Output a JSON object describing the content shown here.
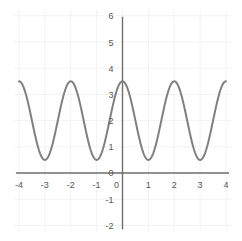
{
  "chart_data": {
    "type": "line",
    "title": "",
    "subtitle": "",
    "xlabel": "",
    "ylabel": "",
    "xlim": [
      -4,
      4
    ],
    "ylim": [
      -2,
      6
    ],
    "grid": true,
    "legend": "none",
    "xticks": [
      "-4",
      "-3",
      "-2",
      "-1",
      "0",
      "1",
      "2",
      "3",
      "4"
    ],
    "xtick_values": [
      -4,
      -3,
      -2,
      -1,
      0,
      1,
      2,
      3,
      4
    ],
    "yticks": [
      "6",
      "5",
      "4",
      "3",
      "2",
      "1",
      "0",
      "-1",
      "-2"
    ],
    "ytick_values": [
      6,
      5,
      4,
      3,
      2,
      1,
      0,
      -1,
      -2
    ],
    "series": [
      {
        "name": "cosine-curve",
        "expression": "y = 2 + 1.5*cos(pi*x)",
        "amplitude": 1.5,
        "midline": 2,
        "period": 2,
        "maximum": 3.5,
        "minimum": 0.5,
        "color": "#808080",
        "line_width": 2,
        "x": [
          -4,
          -3.75,
          -3.5,
          -3.25,
          -3,
          -2.75,
          -2.5,
          -2.25,
          -2,
          -1.75,
          -1.5,
          -1.25,
          -1,
          -0.75,
          -0.5,
          -0.25,
          0,
          0.25,
          0.5,
          0.75,
          1,
          1.25,
          1.5,
          1.75,
          2,
          2.25,
          2.5,
          2.75,
          3,
          3.25,
          3.5,
          3.75,
          4
        ],
        "y": [
          3.5,
          3.06,
          2.0,
          0.94,
          0.5,
          0.94,
          2.0,
          3.06,
          3.5,
          3.06,
          2.0,
          0.94,
          0.5,
          0.94,
          2.0,
          3.06,
          3.5,
          3.06,
          2.0,
          0.94,
          0.5,
          0.94,
          2.0,
          3.06,
          3.5,
          3.06,
          2.0,
          0.94,
          0.5,
          0.94,
          2.0,
          3.06,
          3.5
        ],
        "maxima_at": [
          -4,
          -2,
          0,
          2,
          4
        ],
        "minima_at": [
          -3,
          -1,
          1,
          3
        ]
      }
    ],
    "colors": {
      "curve": "#808080",
      "axis": "#6e6e6e",
      "grid": "#f2f2f2",
      "tick_label": "#555555",
      "background": "#ffffff"
    }
  }
}
